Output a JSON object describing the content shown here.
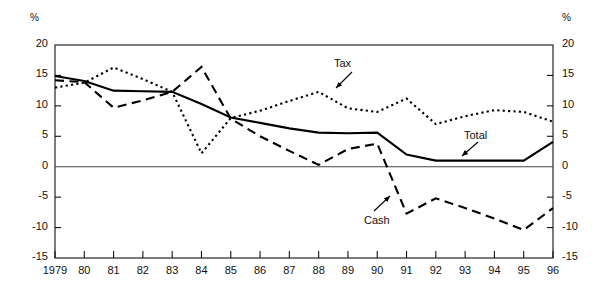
{
  "chart_data": {
    "type": "line",
    "title": "",
    "xlabel": "",
    "ylabel": "%",
    "ylabel_right": "%",
    "ylim": [
      -15,
      20
    ],
    "yticks": [
      20,
      15,
      10,
      5,
      0,
      -5,
      -10,
      -15
    ],
    "ytick_labels": [
      "20",
      "15",
      "10",
      "5",
      "0",
      "-5",
      "-10",
      "-15"
    ],
    "ytick_labels_right": [
      "20",
      "15",
      "10",
      "5",
      "0",
      "-5",
      "-10",
      "-15"
    ],
    "grid": false,
    "legend_position": "inline-annotations",
    "categories": [
      "1979",
      "80",
      "81",
      "82",
      "83",
      "84",
      "85",
      "86",
      "87",
      "88",
      "89",
      "90",
      "91",
      "92",
      "93",
      "94",
      "95",
      "96"
    ],
    "x": [
      1979,
      1980,
      1981,
      1982,
      1983,
      1984,
      1985,
      1986,
      1987,
      1988,
      1989,
      1990,
      1991,
      1992,
      1993,
      1994,
      1995,
      1996
    ],
    "series": [
      {
        "name": "Tax",
        "style": "dotted",
        "values": [
          13.0,
          13.8,
          16.3,
          14.4,
          12.3,
          2.2,
          8.0,
          9.2,
          10.8,
          12.3,
          9.6,
          9.0,
          11.2,
          7.0,
          8.3,
          9.3,
          9.0,
          7.4
        ]
      },
      {
        "name": "Total",
        "style": "solid",
        "values": [
          14.9,
          14.1,
          12.5,
          12.4,
          12.3,
          10.3,
          8.1,
          7.2,
          6.3,
          5.6,
          5.5,
          5.6,
          2.0,
          1.0,
          1.0,
          1.0,
          1.0,
          4.1
        ]
      },
      {
        "name": "Cash",
        "style": "dashed",
        "values": [
          14.2,
          13.9,
          9.7,
          10.9,
          12.3,
          16.4,
          7.9,
          5.0,
          2.6,
          0.3,
          2.9,
          3.8,
          -7.7,
          -5.2,
          -6.8,
          -8.5,
          -10.4,
          -6.8
        ]
      }
    ],
    "annotations": [
      {
        "text": "Tax",
        "series": "Tax",
        "points_to_year": 1988
      },
      {
        "text": "Total",
        "series": "Total",
        "points_to_year": 1993
      },
      {
        "text": "Cash",
        "series": "Cash",
        "points_to_year": 1991
      }
    ]
  }
}
